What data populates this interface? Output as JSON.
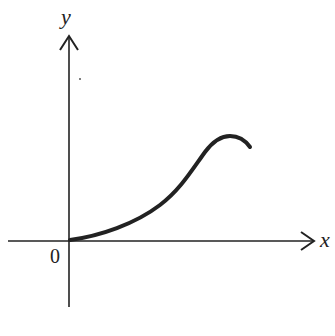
{
  "figure": {
    "type": "graph-sketch",
    "axes": {
      "x_label": "x",
      "y_label": "y",
      "origin_label": "0"
    },
    "colors": {
      "background": "#ffffff",
      "axis": "#222222",
      "curve": "#222222"
    },
    "curve": {
      "description": "Increasing curve starting at the origin, concave up, inflecting, rising to a local maximum then turning down slightly",
      "points": [
        [
          70,
          240
        ],
        [
          95,
          236
        ],
        [
          120,
          228
        ],
        [
          145,
          216
        ],
        [
          165,
          200
        ],
        [
          185,
          180
        ],
        [
          200,
          160
        ],
        [
          212,
          146
        ],
        [
          225,
          138
        ],
        [
          238,
          139
        ],
        [
          250,
          148
        ]
      ]
    }
  }
}
